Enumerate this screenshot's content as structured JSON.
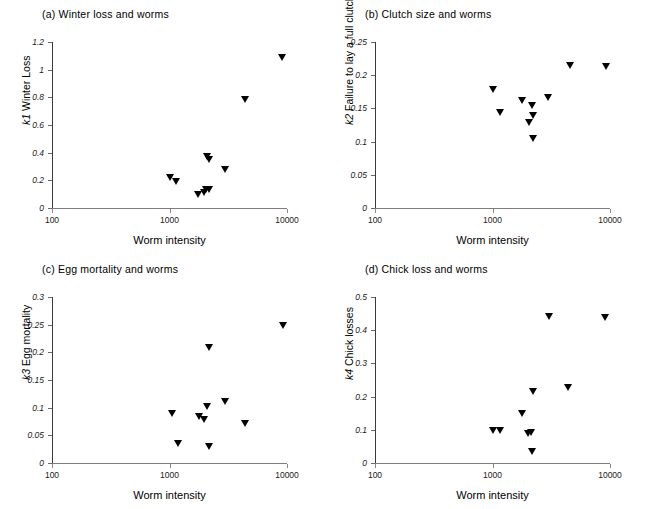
{
  "figure": {
    "background": "#ffffff",
    "marker_color": "#000000",
    "axis_color": "#6f6f6f",
    "width": 646,
    "height": 509
  },
  "shared": {
    "xlabel": "Worm intensity",
    "x_ticks": [
      "100",
      "1000",
      "10000"
    ],
    "x_tick_values": [
      100,
      1000,
      10000
    ],
    "xscale": "log",
    "xlim": [
      100,
      10000
    ],
    "marker": "triangle-down"
  },
  "chart_data": [
    {
      "id": "panel-a",
      "type": "scatter",
      "title": "(a) Winter loss and worms",
      "xlabel": "Worm intensity",
      "ylabel": "k1 Winter Loss",
      "ylabel_prefix": "k1",
      "ylabel_rest": " Winter Loss",
      "xscale": "log",
      "xlim": [
        100,
        10000
      ],
      "ylim": [
        0,
        1.2
      ],
      "grid": false,
      "legend": "none",
      "y_ticks": [
        "0",
        "0.2",
        "0.4",
        "0.6",
        "0.8",
        "1",
        "1.2"
      ],
      "y_tick_values": [
        0,
        0.2,
        0.4,
        0.6,
        0.8,
        1,
        1.2
      ],
      "x_ticks": [
        "100",
        "1000",
        "10000"
      ],
      "x_tick_values": [
        100,
        1000,
        10000
      ],
      "points": [
        {
          "x": 1000,
          "y": 0.205
        },
        {
          "x": 1140,
          "y": 0.178
        },
        {
          "x": 1750,
          "y": 0.082
        },
        {
          "x": 1950,
          "y": 0.1
        },
        {
          "x": 2050,
          "y": 0.118
        },
        {
          "x": 2150,
          "y": 0.12
        },
        {
          "x": 2100,
          "y": 0.355
        },
        {
          "x": 2180,
          "y": 0.335
        },
        {
          "x": 2950,
          "y": 0.265
        },
        {
          "x": 4350,
          "y": 0.77
        },
        {
          "x": 9100,
          "y": 1.07
        }
      ]
    },
    {
      "id": "panel-b",
      "type": "scatter",
      "title": "(b) Clutch size and worms",
      "xlabel": "Worm intensity",
      "ylabel": "k2 Failure to lay a full clutch",
      "ylabel_prefix": "k2",
      "ylabel_rest": " Failure to lay a full clutch",
      "xscale": "log",
      "xlim": [
        100,
        10000
      ],
      "ylim": [
        0,
        0.25
      ],
      "grid": false,
      "legend": "none",
      "y_ticks": [
        "0",
        "0.05",
        "0.1",
        "0.15",
        "0.2",
        "0.25"
      ],
      "y_tick_values": [
        0,
        0.05,
        0.1,
        0.15,
        0.2,
        0.25
      ],
      "x_ticks": [
        "100",
        "1000",
        "10000"
      ],
      "x_tick_values": [
        100,
        1000,
        10000
      ],
      "points": [
        {
          "x": 1010,
          "y": 0.175
        },
        {
          "x": 1150,
          "y": 0.141
        },
        {
          "x": 1780,
          "y": 0.159
        },
        {
          "x": 2060,
          "y": 0.125
        },
        {
          "x": 2180,
          "y": 0.151
        },
        {
          "x": 2200,
          "y": 0.136
        },
        {
          "x": 2220,
          "y": 0.102
        },
        {
          "x": 2950,
          "y": 0.164
        },
        {
          "x": 4600,
          "y": 0.212
        },
        {
          "x": 9250,
          "y": 0.21
        }
      ]
    },
    {
      "id": "panel-c",
      "type": "scatter",
      "title": "(c) Egg mortality and worms",
      "xlabel": "Worm intensity",
      "ylabel": "k3 Egg mortality",
      "ylabel_prefix": "k3",
      "ylabel_rest": " Egg mortality",
      "xscale": "log",
      "xlim": [
        100,
        10000
      ],
      "ylim": [
        0,
        0.3
      ],
      "grid": false,
      "legend": "none",
      "y_ticks": [
        "0",
        "0.05",
        "0.1",
        "0.15",
        "0.2",
        "0.25",
        "0.3"
      ],
      "y_tick_values": [
        0,
        0.05,
        0.1,
        0.15,
        0.2,
        0.25,
        0.3
      ],
      "x_ticks": [
        "100",
        "1000",
        "10000"
      ],
      "x_tick_values": [
        100,
        1000,
        10000
      ],
      "points": [
        {
          "x": 1040,
          "y": 0.086
        },
        {
          "x": 1180,
          "y": 0.031
        },
        {
          "x": 1800,
          "y": 0.08
        },
        {
          "x": 1950,
          "y": 0.074
        },
        {
          "x": 2080,
          "y": 0.099
        },
        {
          "x": 2150,
          "y": 0.205
        },
        {
          "x": 2180,
          "y": 0.026
        },
        {
          "x": 2950,
          "y": 0.107
        },
        {
          "x": 4350,
          "y": 0.068
        },
        {
          "x": 9200,
          "y": 0.244
        }
      ]
    },
    {
      "id": "panel-d",
      "type": "scatter",
      "title": "(d) Chick loss and worms",
      "xlabel": "Worm intensity",
      "ylabel": "k4 Chick losses",
      "ylabel_prefix": "k4",
      "ylabel_rest": " Chick losses",
      "xscale": "log",
      "xlim": [
        100,
        10000
      ],
      "ylim": [
        0,
        0.5
      ],
      "grid": false,
      "legend": "none",
      "y_ticks": [
        "0",
        "0.1",
        "0.2",
        "0.3",
        "0.4",
        "0.5"
      ],
      "y_tick_values": [
        0,
        0.1,
        0.2,
        0.3,
        0.4,
        0.5
      ],
      "x_ticks": [
        "100",
        "1000",
        "10000"
      ],
      "x_tick_values": [
        100,
        1000,
        10000
      ],
      "points": [
        {
          "x": 1000,
          "y": 0.092
        },
        {
          "x": 1150,
          "y": 0.092
        },
        {
          "x": 1800,
          "y": 0.144
        },
        {
          "x": 2020,
          "y": 0.082
        },
        {
          "x": 2130,
          "y": 0.086
        },
        {
          "x": 2180,
          "y": 0.027
        },
        {
          "x": 2200,
          "y": 0.208
        },
        {
          "x": 3000,
          "y": 0.436
        },
        {
          "x": 4400,
          "y": 0.222
        },
        {
          "x": 9150,
          "y": 0.433
        }
      ]
    }
  ]
}
